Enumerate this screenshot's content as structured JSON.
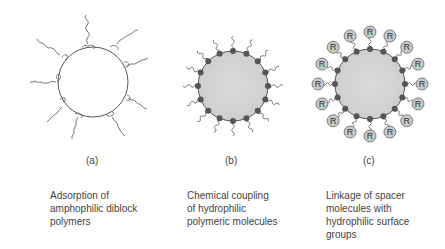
{
  "panels": [
    {
      "label": "(a)",
      "caption": [
        "Adsorption of",
        "amphophilic diblock",
        "polymers"
      ]
    },
    {
      "label": "(b)",
      "caption": [
        "Chemical coupling",
        "of hydrophilic",
        "polymeric molecules"
      ]
    },
    {
      "label": "(c)",
      "caption": [
        "Linkage of spacer",
        "molecules with",
        "hydrophilic surface",
        "groups"
      ]
    }
  ],
  "surface_group_symbol": "R",
  "colors": {
    "particle_fill": "#d4d4d4",
    "anchor": "#555555",
    "r_group_fill": "#c8c8c8",
    "line": "#555555"
  }
}
